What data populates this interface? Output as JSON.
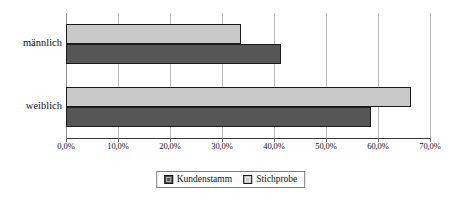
{
  "chart_data": {
    "type": "bar",
    "orientation": "horizontal",
    "title": "",
    "subtitle": "",
    "xlabel": "",
    "ylabel": "",
    "categories": [
      "männlich",
      "weiblich"
    ],
    "series": [
      {
        "name": "Kundenstamm",
        "color": "#565656",
        "values": [
          41.3,
          58.7
        ]
      },
      {
        "name": "Stichprobe",
        "color": "#c9c9c9",
        "values": [
          33.7,
          66.3
        ]
      }
    ],
    "xlim": [
      0,
      70
    ],
    "xtick_values": [
      0,
      10,
      20,
      30,
      40,
      50,
      60,
      70
    ],
    "xtick_labels": [
      "0,0%",
      "10,0%",
      "20,0%",
      "30,0%",
      "40,0%",
      "50,0%",
      "60,0%",
      "70,0%"
    ],
    "grid": true,
    "grid_axis": "x",
    "legend_position": "bottom",
    "value_suffix": "%"
  },
  "axis": {
    "ticks": [
      {
        "value": 0,
        "label": "0,0%"
      },
      {
        "value": 10,
        "label": "10,0%"
      },
      {
        "value": 20,
        "label": "20,0%"
      },
      {
        "value": 30,
        "label": "30,0%"
      },
      {
        "value": 40,
        "label": "40,0%"
      },
      {
        "value": 50,
        "label": "50,0%"
      },
      {
        "value": 60,
        "label": "60,0%"
      },
      {
        "value": 70,
        "label": "70,0%"
      }
    ]
  },
  "categories": [
    {
      "label": "männlich"
    },
    {
      "label": "weiblich"
    }
  ],
  "legend": {
    "items": [
      {
        "label": "Kundenstamm",
        "color": "#565656"
      },
      {
        "label": "Stichprobe",
        "color": "#c9c9c9"
      }
    ]
  }
}
